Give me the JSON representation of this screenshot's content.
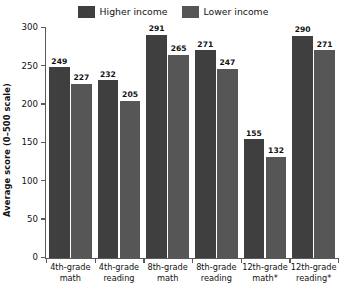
{
  "chart_data": {
    "type": "bar",
    "title": "",
    "xlabel": "",
    "ylabel": "Average score (0–500 scale)",
    "ylim": [
      0,
      300
    ],
    "yticks": [
      0,
      50,
      100,
      150,
      200,
      250,
      300
    ],
    "grid": false,
    "legend_position": "top-center",
    "categories": [
      "4th-grade math",
      "4th-grade reading",
      "8th-grade math",
      "8th-grade reading",
      "12th-grade math*",
      "12th-grade reading*"
    ],
    "category_lines": [
      [
        "4th-grade",
        "math"
      ],
      [
        "4th-grade",
        "reading"
      ],
      [
        "8th-grade",
        "math"
      ],
      [
        "8th-grade",
        "reading"
      ],
      [
        "12th-grade",
        "math*"
      ],
      [
        "12th-grade",
        "reading*"
      ]
    ],
    "series": [
      {
        "name": "Higher income",
        "color": "#3f3f3f",
        "values": [
          249,
          232,
          291,
          271,
          155,
          290
        ]
      },
      {
        "name": "Lower income",
        "color": "#565656",
        "values": [
          227,
          205,
          265,
          247,
          132,
          271
        ]
      }
    ]
  },
  "legend": {
    "entries": [
      {
        "label": "Higher income",
        "swatch": "legend-swatch-higher-income"
      },
      {
        "label": "Lower income",
        "swatch": "legend-swatch-lower-income"
      }
    ]
  },
  "axes": {
    "y_title": "Average score (0–500 scale)",
    "y_tick_labels": [
      "0",
      "50",
      "100",
      "150",
      "200",
      "250",
      "300"
    ]
  },
  "colors": {
    "higher_income": "#3f3f3f",
    "lower_income": "#565656",
    "axis": "#5a5a5a",
    "text": "#111111",
    "background": "#ffffff"
  }
}
